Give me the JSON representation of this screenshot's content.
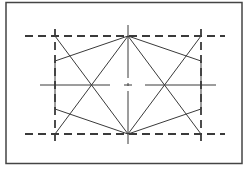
{
  "diagram": {
    "type": "geometric-construction",
    "colors": {
      "background": "#ffffff",
      "stroke": "#3a3a3a",
      "border": "#444444"
    },
    "frame": {
      "x": 6,
      "y": 2.5,
      "width": 236,
      "height": 161
    },
    "dashed_horizontals": [
      {
        "name": "top",
        "x1": 25,
        "y1": 36,
        "x2": 225,
        "y2": 36
      },
      {
        "name": "bottom",
        "x1": 25,
        "y1": 134,
        "x2": 225,
        "y2": 134
      }
    ],
    "dashed_verticals": [
      {
        "name": "left",
        "x1": 55,
        "y1": 29,
        "x2": 55,
        "y2": 141
      },
      {
        "name": "right",
        "x1": 201,
        "y1": 29,
        "x2": 201,
        "y2": 141
      }
    ],
    "center_axis": {
      "cx": 128,
      "cy": 85,
      "v_top": 25,
      "v_bottom": 145,
      "h_left": 40,
      "h_right": 216,
      "gap_left": 110,
      "gap_right": 145
    },
    "hexagon": [
      [
        128,
        36
      ],
      [
        201,
        61
      ],
      [
        201,
        109
      ],
      [
        128,
        134
      ],
      [
        55,
        109
      ],
      [
        55,
        61
      ]
    ],
    "diagonals": [
      {
        "x1": 55,
        "y1": 36,
        "x2": 128,
        "y2": 134
      },
      {
        "x1": 55,
        "y1": 134,
        "x2": 128,
        "y2": 36
      },
      {
        "x1": 128,
        "y1": 36,
        "x2": 201,
        "y2": 134
      },
      {
        "x1": 128,
        "y1": 134,
        "x2": 201,
        "y2": 36
      }
    ]
  }
}
